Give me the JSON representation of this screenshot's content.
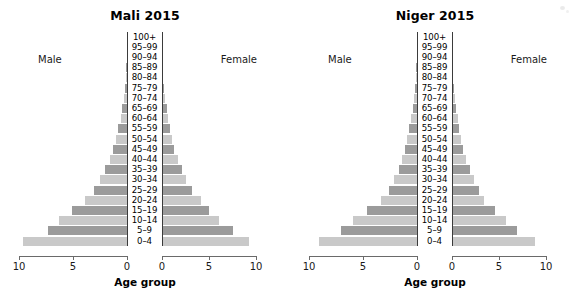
{
  "figure": {
    "background_color": "#ffffff",
    "bar_color_dark": "#9b9b9b",
    "bar_color_light": "#c9c9c9",
    "axis_color": "#3b3b3b"
  },
  "panels": [
    {
      "title": "Mali 2015",
      "male_label": "Male",
      "female_label": "Female",
      "axis_title": "Age group",
      "tick_labels": [
        "10",
        "5",
        "0",
        "0",
        "5",
        "10"
      ]
    },
    {
      "title": "Niger 2015",
      "male_label": "Male",
      "female_label": "Female",
      "axis_title": "Age group",
      "tick_labels": [
        "10",
        "5",
        "0",
        "0",
        "5",
        "10"
      ]
    }
  ],
  "chart_data": [
    {
      "type": "bar",
      "subtype": "population-pyramid",
      "title": "Mali 2015",
      "xlabel": "Age group",
      "ylabel": "",
      "xlim": [
        0,
        10
      ],
      "grid": false,
      "legend": [
        "Male",
        "Female"
      ],
      "legend_position": "inside-top-left and inside-top-right",
      "categories": [
        "0–4",
        "5–9",
        "10–14",
        "15–19",
        "20–24",
        "25–29",
        "30–34",
        "35–39",
        "40–44",
        "45–49",
        "50–54",
        "55–59",
        "60–64",
        "65–69",
        "70–74",
        "75–79",
        "80–84",
        "85–89",
        "90–94",
        "95–99",
        "100+"
      ],
      "series": [
        {
          "name": "Male",
          "direction": "left",
          "values": [
            9.6,
            7.3,
            6.3,
            5.1,
            3.9,
            3.1,
            2.5,
            2.0,
            1.6,
            1.3,
            1.0,
            0.8,
            0.6,
            0.45,
            0.3,
            0.2,
            0.1,
            0.05,
            0.02,
            0.01,
            0.0
          ]
        },
        {
          "name": "Female",
          "direction": "right",
          "values": [
            9.3,
            7.5,
            6.1,
            5.0,
            4.1,
            3.2,
            2.6,
            2.1,
            1.7,
            1.3,
            1.1,
            0.85,
            0.65,
            0.5,
            0.32,
            0.2,
            0.11,
            0.05,
            0.02,
            0.01,
            0.0
          ]
        }
      ],
      "tick_values": [
        10,
        5,
        0,
        0,
        5,
        10
      ]
    },
    {
      "type": "bar",
      "subtype": "population-pyramid",
      "title": "Niger 2015",
      "xlabel": "Age group",
      "ylabel": "",
      "xlim": [
        0,
        10
      ],
      "grid": false,
      "legend": [
        "Male",
        "Female"
      ],
      "legend_position": "inside-top-left and inside-top-right",
      "categories": [
        "0–4",
        "5–9",
        "10–14",
        "15–19",
        "20–24",
        "25–29",
        "30–34",
        "35–39",
        "40–44",
        "45–49",
        "50–54",
        "55–59",
        "60–64",
        "65–69",
        "70–74",
        "75–79",
        "80–84",
        "85–89",
        "90–94",
        "95–99",
        "100+"
      ],
      "series": [
        {
          "name": "Male",
          "direction": "left",
          "values": [
            9.1,
            7.0,
            5.9,
            4.6,
            3.3,
            2.6,
            2.1,
            1.7,
            1.4,
            1.1,
            0.9,
            0.7,
            0.55,
            0.4,
            0.28,
            0.18,
            0.1,
            0.05,
            0.02,
            0.01,
            0.0
          ]
        },
        {
          "name": "Female",
          "direction": "right",
          "values": [
            8.8,
            6.9,
            5.7,
            4.6,
            3.4,
            2.9,
            2.3,
            1.9,
            1.5,
            1.2,
            0.95,
            0.75,
            0.6,
            0.45,
            0.3,
            0.19,
            0.1,
            0.05,
            0.02,
            0.01,
            0.0
          ]
        }
      ],
      "tick_values": [
        10,
        5,
        0,
        0,
        5,
        10
      ]
    }
  ]
}
